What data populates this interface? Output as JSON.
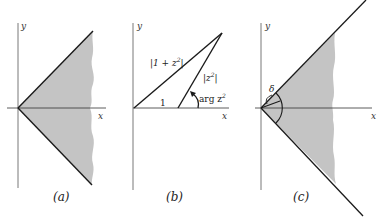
{
  "colors": {
    "ink": "#1a1a1a",
    "axis": "#555555",
    "shade": "#c4c4c4",
    "background": "#ffffff"
  },
  "panels": [
    {
      "id": "a",
      "caption": "(a)",
      "axis_x_label": "x",
      "axis_y_label": "y",
      "description": "Shaded sector symmetric about the positive real axis, bounded by two rays from the origin"
    },
    {
      "id": "b",
      "caption": "(b)",
      "axis_x_label": "x",
      "axis_y_label": "y",
      "labels": {
        "hypotenuse": "|1 + z",
        "hypotenuse_sup": "2",
        "hypotenuse_close": "|",
        "side_z2": "|z",
        "side_z2_sup": "2",
        "side_z2_close": "|",
        "unit": "1",
        "angle": "arg z",
        "angle_sup": "2"
      },
      "description": "Triangle with vertices 0, 1 and 1 + z², angle arg z² marked at 1"
    },
    {
      "id": "c",
      "caption": "(c)",
      "axis_x_label": "x",
      "axis_y_label": "y",
      "labels": {
        "angle": "δ"
      },
      "description": "Shaded sector between two rays with small angle δ arc marked near the origin"
    }
  ]
}
